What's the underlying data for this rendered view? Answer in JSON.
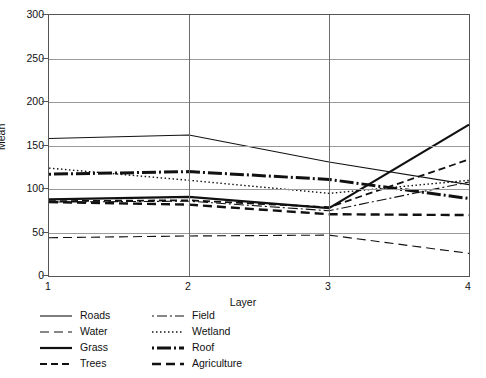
{
  "chart_data": {
    "type": "line",
    "title": "",
    "xlabel": "Layer",
    "ylabel": "Mean",
    "x": [
      1,
      2,
      3,
      4
    ],
    "xlim": [
      1,
      4
    ],
    "ylim": [
      0,
      300
    ],
    "ytick_labels": [
      "0",
      "50",
      "100",
      "150",
      "200",
      "250",
      "300"
    ],
    "ytick_values": [
      0,
      50,
      100,
      150,
      200,
      250,
      300
    ],
    "xtick_labels": [
      "1",
      "2",
      "3",
      "4"
    ],
    "grid": "horizontal-and-vertical",
    "legend_position": "below-plot",
    "series": [
      {
        "name": "Roads",
        "values": [
          158,
          162,
          131,
          105
        ],
        "style": "solid-thin",
        "width": 1.1,
        "dash": "none"
      },
      {
        "name": "Water",
        "values": [
          44,
          46,
          47,
          26
        ],
        "style": "dashed-long-thin",
        "width": 1.1,
        "dash": "9,5"
      },
      {
        "name": "Grass",
        "values": [
          88,
          91,
          78,
          174
        ],
        "style": "solid-thick",
        "width": 2.2,
        "dash": "none"
      },
      {
        "name": "Trees",
        "values": [
          86,
          87,
          79,
          134
        ],
        "style": "dashed-medium",
        "width": 1.8,
        "dash": "7,4"
      },
      {
        "name": "Field",
        "values": [
          85,
          86,
          75,
          108
        ],
        "style": "dash-dot-thin",
        "width": 1.1,
        "dash": "2,3,10,3"
      },
      {
        "name": "Wetland",
        "values": [
          124,
          110,
          95,
          110
        ],
        "style": "dotted",
        "width": 1.4,
        "dash": "1.5,2.5"
      },
      {
        "name": "Roof",
        "values": [
          117,
          120,
          111,
          89
        ],
        "style": "dash-dot-thick",
        "width": 3.0,
        "dash": "2,3,14,3"
      },
      {
        "name": "Agriculture",
        "values": [
          85,
          82,
          71,
          70
        ],
        "style": "dashed-thick",
        "width": 2.4,
        "dash": "9,5"
      }
    ],
    "colors": {
      "line": "#111111",
      "grid": "#9a9a9a",
      "axis": "#555555",
      "background": "#ffffff"
    }
  },
  "legend": {
    "items": [
      {
        "label": "Roads",
        "series": "Roads",
        "col": 0,
        "row": 0
      },
      {
        "label": "Water",
        "series": "Water",
        "col": 0,
        "row": 1
      },
      {
        "label": "Grass",
        "series": "Grass",
        "col": 0,
        "row": 2
      },
      {
        "label": "Trees",
        "series": "Trees",
        "col": 0,
        "row": 3
      },
      {
        "label": "Field",
        "series": "Field",
        "col": 1,
        "row": 0
      },
      {
        "label": "Wetland",
        "series": "Wetland",
        "col": 1,
        "row": 1
      },
      {
        "label": "Roof",
        "series": "Roof",
        "col": 1,
        "row": 2
      },
      {
        "label": "Agriculture",
        "series": "Agriculture",
        "col": 1,
        "row": 3
      }
    ]
  }
}
